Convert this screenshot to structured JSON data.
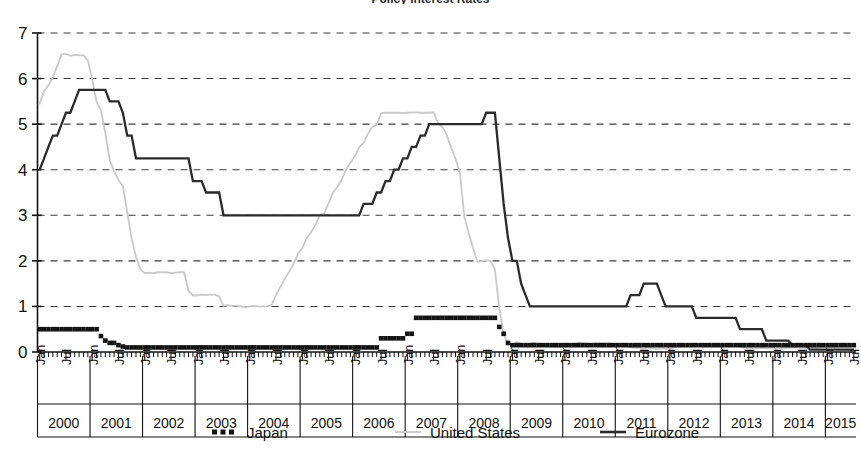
{
  "chart_data": {
    "type": "line",
    "title": "Policy Interest Rates",
    "xlabel": "",
    "ylabel": "",
    "ylim": [
      0,
      7
    ],
    "yticks": [
      0,
      1,
      2,
      3,
      4,
      5,
      6,
      7
    ],
    "ytick_labels": [
      "0",
      "1",
      "2",
      "3",
      "4",
      "5",
      "6",
      "7"
    ],
    "grid": true,
    "grid_style": "dashed-horizontal",
    "legend_position": "bottom",
    "x_months": [
      "Jan",
      "Jul"
    ],
    "x_years": [
      "2000",
      "2001",
      "2002",
      "2003",
      "2004",
      "2005",
      "2006",
      "2007",
      "2008",
      "2009",
      "2010",
      "2011",
      "2012",
      "2013",
      "2014",
      "2015"
    ],
    "x_range": [
      "Jan 2000",
      "Jul 2015"
    ],
    "series": [
      {
        "name": "Japan",
        "color": "#141414",
        "style": "dotted-square",
        "values": [
          0.5,
          0.5,
          0.5,
          0.5,
          0.5,
          0.5,
          0.5,
          0.5,
          0.5,
          0.5,
          0.5,
          0.5,
          0.5,
          0.5,
          0.35,
          0.25,
          0.2,
          0.2,
          0.15,
          0.12,
          0.1,
          0.1,
          0.1,
          0.1,
          0.1,
          0.1,
          0.1,
          0.1,
          0.1,
          0.1,
          0.1,
          0.1,
          0.1,
          0.1,
          0.1,
          0.1,
          0.1,
          0.1,
          0.1,
          0.1,
          0.1,
          0.1,
          0.1,
          0.1,
          0.1,
          0.1,
          0.1,
          0.1,
          0.1,
          0.1,
          0.1,
          0.1,
          0.1,
          0.1,
          0.1,
          0.1,
          0.1,
          0.1,
          0.1,
          0.1,
          0.1,
          0.1,
          0.1,
          0.1,
          0.1,
          0.1,
          0.1,
          0.1,
          0.1,
          0.1,
          0.1,
          0.1,
          0.1,
          0.1,
          0.1,
          0.1,
          0.1,
          0.1,
          0.3,
          0.3,
          0.3,
          0.3,
          0.3,
          0.3,
          0.4,
          0.4,
          0.75,
          0.75,
          0.75,
          0.75,
          0.75,
          0.75,
          0.75,
          0.75,
          0.75,
          0.75,
          0.75,
          0.75,
          0.75,
          0.75,
          0.75,
          0.75,
          0.75,
          0.75,
          0.75,
          0.55,
          0.4,
          0.2,
          0.15,
          0.15,
          0.15,
          0.15,
          0.15,
          0.15,
          0.15,
          0.15,
          0.15,
          0.15,
          0.15,
          0.15,
          0.15,
          0.15,
          0.15,
          0.15,
          0.15,
          0.15,
          0.15,
          0.15,
          0.15,
          0.15,
          0.15,
          0.15,
          0.15,
          0.15,
          0.15,
          0.15,
          0.15,
          0.15,
          0.15,
          0.15,
          0.15,
          0.15,
          0.15,
          0.15,
          0.15,
          0.15,
          0.15,
          0.15,
          0.15,
          0.15,
          0.15,
          0.15,
          0.15,
          0.15,
          0.15,
          0.15,
          0.15,
          0.15,
          0.15,
          0.15,
          0.15,
          0.15,
          0.15,
          0.15,
          0.15,
          0.15,
          0.15,
          0.15,
          0.15,
          0.15,
          0.15,
          0.15,
          0.15,
          0.15,
          0.15,
          0.15,
          0.15,
          0.15,
          0.15,
          0.15,
          0.15,
          0.15,
          0.15,
          0.15,
          0.15,
          0.15,
          0.15
        ]
      },
      {
        "name": "United States",
        "color": "#c9c9c9",
        "style": "solid-thin",
        "values": [
          5.45,
          5.73,
          5.85,
          6.02,
          6.27,
          6.53,
          6.54,
          6.5,
          6.52,
          6.51,
          6.51,
          6.4,
          5.98,
          5.49,
          5.31,
          4.8,
          4.21,
          3.97,
          3.77,
          3.65,
          3.07,
          2.49,
          2.09,
          1.82,
          1.73,
          1.74,
          1.73,
          1.75,
          1.75,
          1.75,
          1.73,
          1.74,
          1.75,
          1.75,
          1.34,
          1.24,
          1.24,
          1.26,
          1.25,
          1.26,
          1.26,
          1.22,
          1.01,
          1.03,
          1.01,
          1.01,
          1.0,
          0.98,
          1.0,
          1.01,
          1.0,
          1.0,
          1.0,
          1.03,
          1.26,
          1.43,
          1.61,
          1.76,
          1.93,
          2.16,
          2.28,
          2.5,
          2.63,
          2.79,
          3.0,
          3.04,
          3.26,
          3.5,
          3.62,
          3.78,
          4.0,
          4.16,
          4.29,
          4.49,
          4.59,
          4.79,
          4.94,
          4.99,
          5.24,
          5.25,
          5.25,
          5.25,
          5.25,
          5.24,
          5.25,
          5.26,
          5.26,
          5.25,
          5.25,
          5.25,
          5.26,
          5.02,
          4.94,
          4.76,
          4.49,
          4.24,
          3.94,
          2.98,
          2.61,
          2.28,
          1.98,
          2.0,
          2.01,
          2.0,
          1.81,
          0.97,
          0.39,
          0.16,
          0.15,
          0.22,
          0.18,
          0.15,
          0.18,
          0.21,
          0.16,
          0.16,
          0.15,
          0.12,
          0.12,
          0.12,
          0.11,
          0.13,
          0.16,
          0.2,
          0.2,
          0.18,
          0.18,
          0.19,
          0.19,
          0.19,
          0.19,
          0.18,
          0.17,
          0.16,
          0.14,
          0.1,
          0.09,
          0.09,
          0.07,
          0.1,
          0.08,
          0.07,
          0.08,
          0.07,
          0.08,
          0.1,
          0.13,
          0.14,
          0.16,
          0.16,
          0.16,
          0.13,
          0.14,
          0.16,
          0.16,
          0.16,
          0.14,
          0.15,
          0.14,
          0.15,
          0.11,
          0.09,
          0.09,
          0.08,
          0.08,
          0.09,
          0.08,
          0.09,
          0.07,
          0.07,
          0.08,
          0.09,
          0.09,
          0.1,
          0.09,
          0.09,
          0.09,
          0.09,
          0.09,
          0.12,
          0.11,
          0.11,
          0.11,
          0.12,
          0.12,
          0.13,
          0.13
        ]
      },
      {
        "name": "Eurozone",
        "color": "#2b2b2b",
        "style": "solid-thick",
        "values": [
          4.0,
          4.25,
          4.5,
          4.75,
          4.75,
          5.0,
          5.25,
          5.25,
          5.5,
          5.75,
          5.75,
          5.75,
          5.75,
          5.75,
          5.75,
          5.75,
          5.5,
          5.5,
          5.5,
          5.25,
          4.75,
          4.75,
          4.25,
          4.25,
          4.25,
          4.25,
          4.25,
          4.25,
          4.25,
          4.25,
          4.25,
          4.25,
          4.25,
          4.25,
          4.25,
          3.75,
          3.75,
          3.75,
          3.5,
          3.5,
          3.5,
          3.5,
          3.0,
          3.0,
          3.0,
          3.0,
          3.0,
          3.0,
          3.0,
          3.0,
          3.0,
          3.0,
          3.0,
          3.0,
          3.0,
          3.0,
          3.0,
          3.0,
          3.0,
          3.0,
          3.0,
          3.0,
          3.0,
          3.0,
          3.0,
          3.0,
          3.0,
          3.0,
          3.0,
          3.0,
          3.0,
          3.0,
          3.0,
          3.0,
          3.25,
          3.25,
          3.25,
          3.5,
          3.5,
          3.75,
          3.75,
          4.0,
          4.0,
          4.25,
          4.25,
          4.5,
          4.5,
          4.75,
          4.75,
          5.0,
          5.0,
          5.0,
          5.0,
          5.0,
          5.0,
          5.0,
          5.0,
          5.0,
          5.0,
          5.0,
          5.0,
          5.0,
          5.25,
          5.25,
          5.25,
          4.25,
          3.25,
          2.5,
          2.0,
          2.0,
          1.5,
          1.25,
          1.0,
          1.0,
          1.0,
          1.0,
          1.0,
          1.0,
          1.0,
          1.0,
          1.0,
          1.0,
          1.0,
          1.0,
          1.0,
          1.0,
          1.0,
          1.0,
          1.0,
          1.0,
          1.0,
          1.0,
          1.0,
          1.0,
          1.0,
          1.25,
          1.25,
          1.25,
          1.5,
          1.5,
          1.5,
          1.5,
          1.25,
          1.0,
          1.0,
          1.0,
          1.0,
          1.0,
          1.0,
          1.0,
          0.75,
          0.75,
          0.75,
          0.75,
          0.75,
          0.75,
          0.75,
          0.75,
          0.75,
          0.75,
          0.5,
          0.5,
          0.5,
          0.5,
          0.5,
          0.5,
          0.25,
          0.25,
          0.25,
          0.25,
          0.25,
          0.25,
          0.15,
          0.15,
          0.15,
          0.15,
          0.05,
          0.05,
          0.05,
          0.05,
          0.05,
          0.05,
          0.05,
          0.05,
          0.05,
          0.05,
          0.05
        ]
      }
    ]
  },
  "legend": {
    "items": [
      {
        "label": "Japan",
        "marker": "dotted-square"
      },
      {
        "label": "United States",
        "marker": "line-light"
      },
      {
        "label": "Eurozone",
        "marker": "line-dark"
      }
    ]
  }
}
